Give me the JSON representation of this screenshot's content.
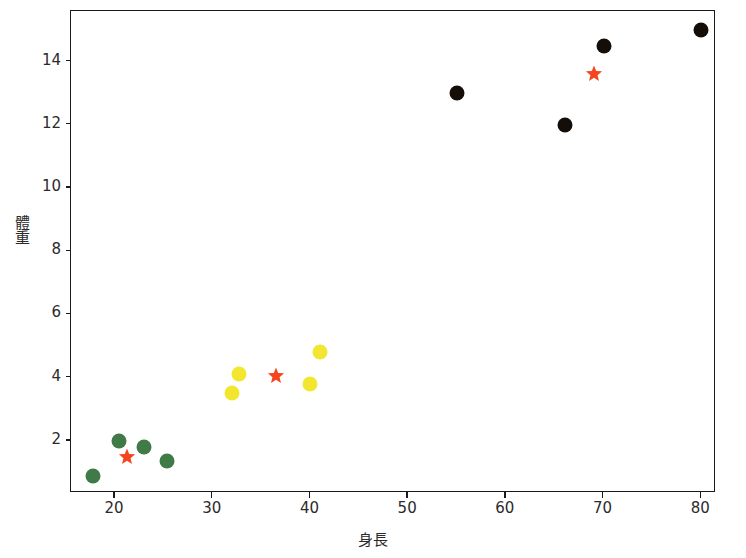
{
  "chart_data": {
    "type": "scatter",
    "title": "",
    "xlabel": "身長",
    "ylabel": "體重",
    "xlim": [
      15.5,
      81.5
    ],
    "ylim": [
      0.35,
      15.6
    ],
    "xticks": [
      20,
      30,
      40,
      50,
      60,
      70,
      80
    ],
    "yticks": [
      2,
      4,
      6,
      8,
      10,
      12,
      14
    ],
    "grid": false,
    "legend": "none",
    "series": [
      {
        "name": "cluster-green",
        "marker": "circle",
        "color": "#3f7a47",
        "points": [
          {
            "x": 17.7,
            "y": 0.9
          },
          {
            "x": 20.4,
            "y": 2.0
          },
          {
            "x": 23.0,
            "y": 1.8
          },
          {
            "x": 25.3,
            "y": 1.35
          }
        ]
      },
      {
        "name": "cluster-yellow",
        "marker": "circle",
        "color": "#f2e62e",
        "points": [
          {
            "x": 32.0,
            "y": 3.5
          },
          {
            "x": 32.7,
            "y": 4.1
          },
          {
            "x": 40.0,
            "y": 3.8
          },
          {
            "x": 41.0,
            "y": 4.8
          }
        ]
      },
      {
        "name": "cluster-black",
        "marker": "circle",
        "color": "#150d07",
        "points": [
          {
            "x": 55.0,
            "y": 13.0
          },
          {
            "x": 66.0,
            "y": 12.0
          },
          {
            "x": 70.0,
            "y": 14.5
          },
          {
            "x": 80.0,
            "y": 15.0
          }
        ]
      },
      {
        "name": "centroids",
        "marker": "star",
        "color": "#f4451e",
        "points": [
          {
            "x": 21.2,
            "y": 1.5
          },
          {
            "x": 36.5,
            "y": 4.05
          },
          {
            "x": 69.0,
            "y": 13.6
          }
        ]
      }
    ]
  },
  "axes": {
    "x_label": "身長",
    "y_label": "體重",
    "x_tick_labels": [
      "20",
      "30",
      "40",
      "50",
      "60",
      "70",
      "80"
    ],
    "y_tick_labels": [
      "2",
      "4",
      "6",
      "8",
      "10",
      "12",
      "14"
    ]
  },
  "title": {
    "text": ""
  },
  "colors": {
    "green": "#3f7a47",
    "yellow": "#f2e62e",
    "black": "#150d07",
    "star": "#f4451e",
    "axis": "#1a1a1a",
    "background": "#ffffff"
  }
}
